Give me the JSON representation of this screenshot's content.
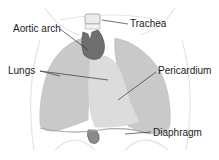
{
  "diagram": {
    "type": "anatomical-illustration",
    "labels": [
      {
        "id": "aortic-arch",
        "text": "Aortic arch",
        "x": 13,
        "y": 24
      },
      {
        "id": "trachea",
        "text": "Trachea",
        "x": 130,
        "y": 19
      },
      {
        "id": "lungs",
        "text": "Lungs",
        "x": 8,
        "y": 66
      },
      {
        "id": "pericardium",
        "text": "Pericardium",
        "x": 158,
        "y": 66
      },
      {
        "id": "diaphragm",
        "text": "Diaphragm",
        "x": 153,
        "y": 128
      }
    ],
    "colors": {
      "lung_fill": "#c8c8c8",
      "pericardium_fill": "#dcdcdc",
      "aorta_fill": "#6e6e6e",
      "trachea_fill": "#e8e8e8",
      "outline": "#e2e2e2",
      "leader_line": "#333333",
      "text": "#1a1a1a"
    }
  }
}
